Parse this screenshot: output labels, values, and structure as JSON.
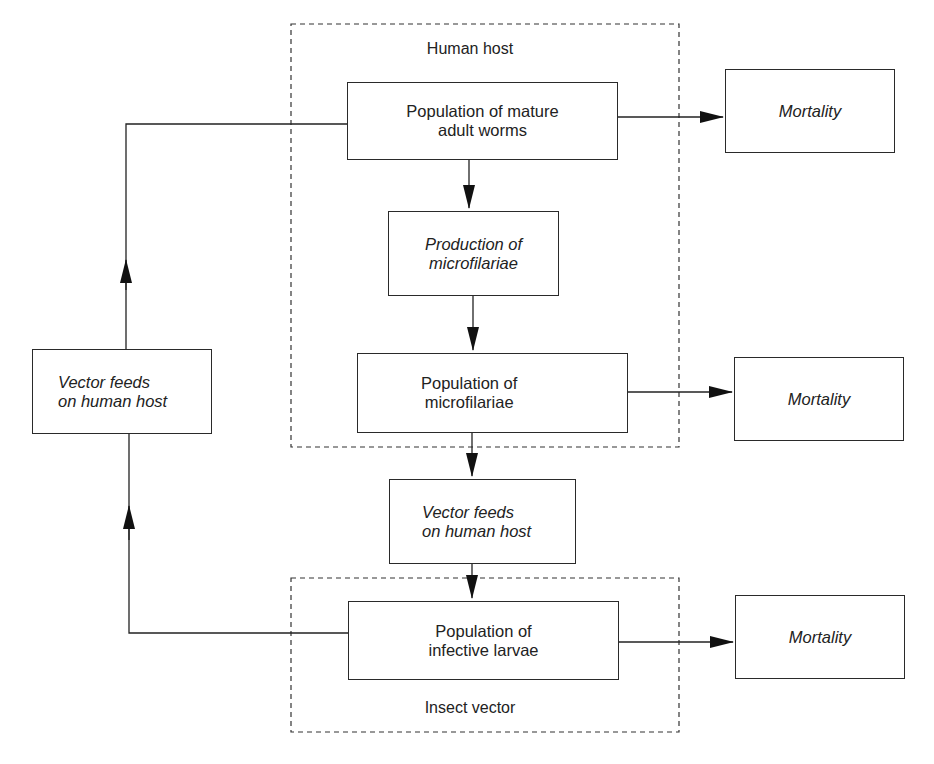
{
  "diagram": {
    "groups": {
      "human_host": {
        "label": "Human host"
      },
      "insect_vector": {
        "label": "Insect vector"
      }
    },
    "nodes": {
      "adult_worms": {
        "line1": "Population of mature",
        "line2": "adult worms"
      },
      "production_mf": {
        "line1": "Production of",
        "line2": "microfilariae"
      },
      "population_mf": {
        "line1": "Population of",
        "line2": "microfilariae"
      },
      "vector_feeds_center": {
        "line1": "Vector feeds",
        "line2": "on human host"
      },
      "infective_larvae": {
        "line1": "Population of",
        "line2": "infective larvae"
      },
      "vector_feeds_left": {
        "line1": "Vector feeds",
        "line2": "on human host"
      },
      "mortality_1": {
        "label": "Mortality"
      },
      "mortality_2": {
        "label": "Mortality"
      },
      "mortality_3": {
        "label": "Mortality"
      }
    },
    "edges": [
      {
        "from": "adult_worms",
        "to": "production_mf"
      },
      {
        "from": "production_mf",
        "to": "population_mf"
      },
      {
        "from": "population_mf",
        "to": "vector_feeds_center"
      },
      {
        "from": "vector_feeds_center",
        "to": "infective_larvae"
      },
      {
        "from": "infective_larvae",
        "to": "vector_feeds_left"
      },
      {
        "from": "vector_feeds_left",
        "to": "adult_worms"
      },
      {
        "from": "adult_worms",
        "to": "mortality_1"
      },
      {
        "from": "population_mf",
        "to": "mortality_2"
      },
      {
        "from": "infective_larvae",
        "to": "mortality_3"
      }
    ]
  }
}
